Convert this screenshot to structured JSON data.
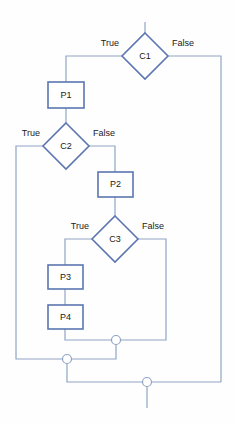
{
  "diagram": {
    "type": "flowchart",
    "colors": {
      "stroke": "#5b76b0",
      "connector": "#8fa4c4",
      "shape_fill": "#ffffff",
      "text": "#1a1a1a",
      "background": "#fefefe"
    },
    "nodes": [
      {
        "id": "C1",
        "label": "C1",
        "shape": "diamond",
        "cx": 145,
        "cy": 56,
        "rx": 23,
        "ry": 23
      },
      {
        "id": "P1",
        "label": "P1",
        "shape": "rect",
        "x": 48,
        "y": 82,
        "w": 36,
        "h": 26
      },
      {
        "id": "C2",
        "label": "C2",
        "shape": "diamond",
        "cx": 66,
        "cy": 146,
        "rx": 23,
        "ry": 23
      },
      {
        "id": "P2",
        "label": "P2",
        "shape": "rect",
        "x": 98,
        "y": 172,
        "w": 35,
        "h": 25
      },
      {
        "id": "C3",
        "label": "C3",
        "shape": "diamond",
        "cx": 115,
        "cy": 239,
        "rx": 23,
        "ry": 23
      },
      {
        "id": "P3",
        "label": "P3",
        "shape": "rect",
        "x": 48,
        "y": 265,
        "w": 35,
        "h": 24
      },
      {
        "id": "P4",
        "label": "P4",
        "shape": "rect",
        "x": 48,
        "y": 305,
        "w": 35,
        "h": 24
      }
    ],
    "edge_labels": [
      {
        "id": "c1-true",
        "text": "True",
        "x": 119,
        "y": 44,
        "align": "left"
      },
      {
        "id": "c1-false",
        "text": "False",
        "x": 172,
        "y": 44,
        "align": "right"
      },
      {
        "id": "c2-true",
        "text": "True",
        "x": 40,
        "y": 134,
        "align": "left"
      },
      {
        "id": "c2-false",
        "text": "False",
        "x": 93,
        "y": 134,
        "align": "right"
      },
      {
        "id": "c3-true",
        "text": "True",
        "x": 89,
        "y": 227,
        "align": "left"
      },
      {
        "id": "c3-false",
        "text": "False",
        "x": 142,
        "y": 227,
        "align": "right"
      }
    ],
    "junctions": [
      {
        "id": "j1",
        "cx": 116,
        "cy": 340,
        "r": 4.5
      },
      {
        "id": "j2",
        "cx": 67,
        "cy": 359,
        "r": 4.5
      },
      {
        "id": "j3",
        "cx": 147,
        "cy": 382,
        "r": 4.5
      }
    ],
    "connectors": [
      {
        "id": "entry-into-c1",
        "d": "M 145 22 L 145 33"
      },
      {
        "id": "c1-true-to-p1",
        "d": "M 122 56 L 66 56 L 66 82"
      },
      {
        "id": "c1-false-to-right-rail",
        "d": "M 168 56 L 221 56 L 221 382"
      },
      {
        "id": "p1-to-c2",
        "d": "M 66 108 L 66 123"
      },
      {
        "id": "c2-true-to-left-rail",
        "d": "M 43 146 L 16 146 L 16 359 L 67 359"
      },
      {
        "id": "c2-false-to-p2",
        "d": "M 89 146 L 115 146 L 115 172"
      },
      {
        "id": "p2-to-c3",
        "d": "M 115 197 L 115 216"
      },
      {
        "id": "c3-true-to-p3",
        "d": "M 92 239 L 65 239 L 65 265"
      },
      {
        "id": "c3-false-to-junction1",
        "d": "M 138 239 L 166 239 L 166 340 L 116 340"
      },
      {
        "id": "p3-to-p4",
        "d": "M 65 289 L 65 305"
      },
      {
        "id": "p4-to-junction1",
        "d": "M 65 329 L 65 340 L 116 340"
      },
      {
        "id": "junction1-to-junction2",
        "d": "M 116 340 L 116 359 L 67 359"
      },
      {
        "id": "junction2-to-junction3",
        "d": "M 67 359 L 67 382 L 221 382"
      },
      {
        "id": "exit-from-junction3",
        "d": "M 147 382 L 147 408"
      }
    ]
  }
}
